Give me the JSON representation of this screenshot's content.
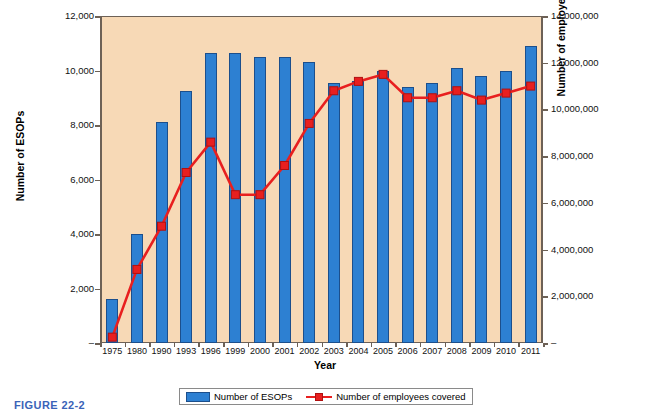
{
  "caption": "FIGURE 22-2",
  "legend": {
    "bar_label": "Number of ESOPs",
    "line_label": "Number of employees covered"
  },
  "colors": {
    "plot_background": "#f7d9b6",
    "bar_fill": "#2d80d2",
    "bar_border": "#1c4f8c",
    "line": "#e81f1f",
    "marker_border": "#b01010",
    "axis": "#6d6156",
    "caption": "#3a63b8"
  },
  "chart_data": {
    "type": "bar",
    "title": "",
    "subtitle": "",
    "xlabel": "Year",
    "ylabel": "Number of ESOPs",
    "y2label": "Number of employees covered",
    "grid": false,
    "legend_position": "bottom",
    "ylim": [
      0,
      12000
    ],
    "y2lim": [
      0,
      14000000
    ],
    "yticks": [
      "–",
      "2,000",
      "4,000",
      "6,000",
      "8,000",
      "10,000",
      "12,000"
    ],
    "ytick_values": [
      0,
      2000,
      4000,
      6000,
      8000,
      10000,
      12000
    ],
    "y2ticks": [
      "–",
      "2,000,000",
      "4,000,000",
      "6,000,000",
      "8,000,000",
      "10,000,000",
      "12,000,000",
      "14,000,000"
    ],
    "y2tick_values": [
      0,
      2000000,
      4000000,
      6000000,
      8000000,
      10000000,
      12000000,
      14000000
    ],
    "categories": [
      "1975",
      "1980",
      "1990",
      "1993",
      "1996",
      "1999",
      "2000",
      "2001",
      "2002",
      "2003",
      "2004",
      "2005",
      "2006",
      "2007",
      "2008",
      "2009",
      "2010",
      "2011"
    ],
    "series": [
      {
        "name": "Number of ESOPs",
        "kind": "bar",
        "axis": "left",
        "values": [
          1600,
          4000,
          8100,
          9250,
          10650,
          10650,
          10500,
          10500,
          10300,
          9550,
          9600,
          10000,
          9400,
          9550,
          10100,
          9800,
          10000,
          10900
        ]
      },
      {
        "name": "Number of employees covered",
        "kind": "line",
        "axis": "right",
        "values": [
          250000,
          3150000,
          5000000,
          7300000,
          8600000,
          6350000,
          6350000,
          7600000,
          9400000,
          10800000,
          11200000,
          11500000,
          10500000,
          10500000,
          10800000,
          10400000,
          10700000,
          11000000
        ]
      }
    ]
  }
}
